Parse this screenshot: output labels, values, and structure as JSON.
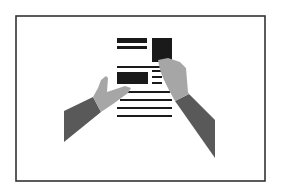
{
  "illustration": {
    "subject": "hands holding newspaper",
    "frame": {
      "x": 16,
      "y": 16,
      "w": 249,
      "h": 165,
      "stroke": "#333333",
      "stroke_width": 1.6
    },
    "colors": {
      "ink": "#1a1a1a",
      "skin": "#a6a6a6",
      "sleeve": "#595959",
      "background": "#ffffff"
    },
    "newspaper": {
      "bars": [
        {
          "x": 117,
          "y": 38,
          "w": 30,
          "h": 5
        },
        {
          "x": 117,
          "y": 46,
          "w": 30,
          "h": 3
        },
        {
          "x": 117,
          "y": 66,
          "w": 55,
          "h": 2
        },
        {
          "x": 117,
          "y": 72,
          "w": 31,
          "h": 12
        },
        {
          "x": 152,
          "y": 70,
          "w": 10,
          "h": 2
        },
        {
          "x": 152,
          "y": 76,
          "w": 10,
          "h": 2
        },
        {
          "x": 152,
          "y": 82,
          "w": 10,
          "h": 2
        },
        {
          "x": 124,
          "y": 91,
          "w": 46,
          "h": 2
        },
        {
          "x": 120,
          "y": 99,
          "w": 52,
          "h": 2
        },
        {
          "x": 117,
          "y": 107,
          "w": 55,
          "h": 2
        },
        {
          "x": 117,
          "y": 115,
          "w": 55,
          "h": 2
        }
      ],
      "photo_block": {
        "x": 152,
        "y": 38,
        "w": 20,
        "h": 24
      }
    },
    "left_arm": {
      "sleeve": "64,111 93,97 101,112 64,142",
      "hand": "93,97 98,88 101,80 106,76 108,78 107,92 125,86 131,88 128,93 113,104 101,112"
    },
    "right_arm": {
      "sleeve": "175,101 189,94 215,120 215,158",
      "hand": "158,60 168,58 180,62 186,68 188,92 189,94 175,101 170,92 164,80 160,70"
    }
  }
}
